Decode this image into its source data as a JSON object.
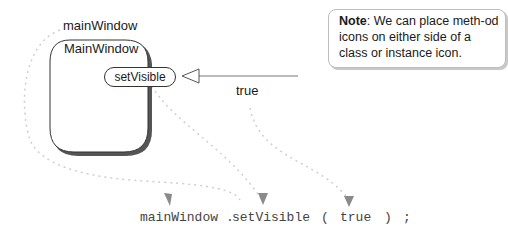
{
  "diagram": {
    "instance": {
      "variable_label": "mainWindow",
      "class_label": "MainWindow"
    },
    "method": {
      "label": "setVisible"
    },
    "argument": {
      "label": "true"
    },
    "note": {
      "title": "Note",
      "text": ": We can place meth-od icons on either side of a class or instance icon.",
      "lines": [
        "Note: We can place meth-",
        "od icons on either side of a",
        "class or instance icon."
      ]
    },
    "code": {
      "tokens": [
        "mainWindow",
        ".",
        "setVisible",
        "(",
        "true",
        ")",
        ";"
      ]
    }
  }
}
